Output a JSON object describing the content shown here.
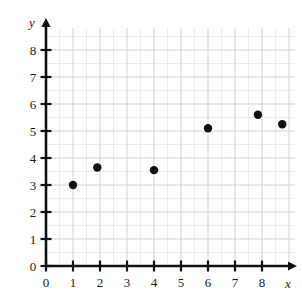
{
  "chart_data": {
    "type": "scatter",
    "title": "",
    "subtitle": "",
    "xlabel": "x",
    "ylabel": "y",
    "xlim": [
      0,
      9
    ],
    "ylim": [
      0,
      8.6
    ],
    "xticks": [
      0,
      1,
      2,
      3,
      4,
      5,
      6,
      7,
      8
    ],
    "yticks": [
      0,
      1,
      2,
      3,
      4,
      5,
      6,
      7,
      8
    ],
    "xtick_labels": [
      "0",
      "1",
      "2",
      "3",
      "4",
      "5",
      "6",
      "7",
      "8"
    ],
    "ytick_labels": [
      "0",
      "1",
      "2",
      "3",
      "4",
      "5",
      "6",
      "7",
      "8"
    ],
    "grid": true,
    "grid_minor_subdivisions": 2,
    "grid_color": "#c9c9d2",
    "axis_color": "#111111",
    "marker_color": "#111111",
    "marker_radius": 4.2,
    "background": "#ffffff",
    "legend": null,
    "annotations": [],
    "series": [
      {
        "name": "data",
        "points": [
          {
            "x": 1.0,
            "y": 3.0
          },
          {
            "x": 1.9,
            "y": 3.65
          },
          {
            "x": 4.0,
            "y": 3.55
          },
          {
            "x": 6.0,
            "y": 5.1
          },
          {
            "x": 7.85,
            "y": 5.6
          },
          {
            "x": 8.75,
            "y": 5.25
          }
        ]
      }
    ]
  }
}
